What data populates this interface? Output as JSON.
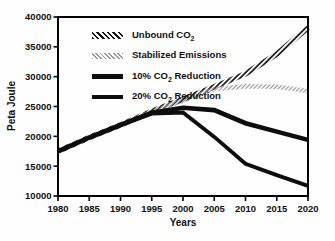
{
  "figure": {
    "background": "#fefefe",
    "frame_color": "#000000"
  },
  "colors": {
    "line_black": "#0d0d0d",
    "hatch_dark": "#161616",
    "hatch_gray": "#989898",
    "text": "#111111"
  },
  "chart_data": {
    "type": "line",
    "title": "",
    "xlabel": "Years",
    "ylabel": "Peta Joule",
    "xlim": [
      1980,
      2020
    ],
    "ylim": [
      10000,
      40000
    ],
    "grid": false,
    "legend_position": "top-left-inside",
    "x": [
      1980,
      1985,
      1990,
      1995,
      2000,
      2005,
      2010,
      2015,
      2020
    ],
    "x_ticks": [
      "1980",
      "1985",
      "1990",
      "1995",
      "2000",
      "2005",
      "2010",
      "2015",
      "2020"
    ],
    "y_ticks": [
      "10000",
      "15000",
      "20000",
      "25000",
      "30000",
      "35000",
      "40000"
    ],
    "series": [
      {
        "name": "Unbound CO2",
        "style": "hatched-dark",
        "values": [
          17500,
          19800,
          21900,
          24200,
          26200,
          28300,
          30500,
          33800,
          38200
        ]
      },
      {
        "name": "Stabilized Emissions",
        "style": "hatched-gray",
        "values": [
          17500,
          19800,
          21900,
          24200,
          26000,
          27900,
          28400,
          28300,
          27600
        ]
      },
      {
        "name": "10% CO2 Reduction",
        "style": "solid-thick",
        "values": [
          17500,
          19800,
          21900,
          23950,
          24800,
          24400,
          22200,
          20800,
          19400
        ]
      },
      {
        "name": "20% CO2 Reduction",
        "style": "solid-medium",
        "values": [
          17500,
          19800,
          21900,
          23800,
          24000,
          19900,
          15400,
          13500,
          11700
        ]
      }
    ]
  },
  "legend": {
    "items": [
      {
        "pre": "Unbound CO",
        "sub": "2",
        "post": ""
      },
      {
        "pre": "Stabilized Emissions",
        "sub": "",
        "post": ""
      },
      {
        "pre": "10% CO",
        "sub": "2",
        "post": " Reduction"
      },
      {
        "pre": "20% CO",
        "sub": "2",
        "post": " Reduction"
      }
    ]
  }
}
